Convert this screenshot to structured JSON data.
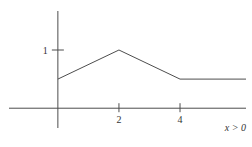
{
  "chart_data": {
    "type": "line",
    "title": "",
    "xlabel": "",
    "ylabel": "",
    "annotation": "x > 0",
    "points": [
      {
        "x": 0,
        "y": 0.5
      },
      {
        "x": 2,
        "y": 1
      },
      {
        "x": 4,
        "y": 0.5
      },
      {
        "x": 6.16,
        "y": 0.5
      }
    ],
    "x_ticks": [
      {
        "value": 2,
        "label": "2"
      },
      {
        "value": 4,
        "label": "4"
      }
    ],
    "y_ticks": [
      {
        "value": 1,
        "label": "1"
      }
    ],
    "x_range": [
      -1.6,
      6.16
    ],
    "y_range": [
      -0.34,
      1.67
    ],
    "grid": false,
    "legend": null,
    "line_color": "#4d4d4d",
    "axis_color": "#4d4d4d",
    "text_color": "#333333"
  }
}
